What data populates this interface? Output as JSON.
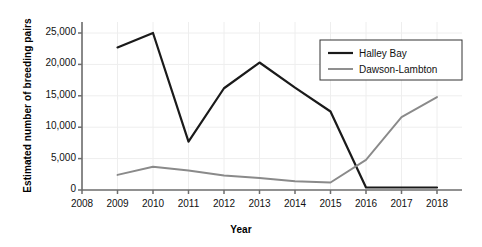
{
  "chart_data": {
    "type": "line",
    "title": "",
    "xlabel": "Year",
    "ylabel": "Estimated number of breeding pairs",
    "x": [
      2008,
      2009,
      2010,
      2011,
      2012,
      2013,
      2014,
      2015,
      2016,
      2017,
      2018
    ],
    "xlim": [
      2008,
      2018
    ],
    "ylim": [
      0,
      26500
    ],
    "yticks": [
      0,
      5000,
      10000,
      15000,
      20000,
      25000
    ],
    "ytick_labels": [
      "0",
      "5,000",
      "10,000",
      "15,000",
      "20,000",
      "25,000"
    ],
    "xtick_labels": [
      "2008",
      "2009",
      "2010",
      "2011",
      "2012",
      "2013",
      "2014",
      "2015",
      "2016",
      "2017",
      "2018"
    ],
    "grid": true,
    "legend_position": "upper right",
    "series": [
      {
        "name": "Halley Bay",
        "color": "#1a1a1a",
        "x": [
          2009,
          2010,
          2011,
          2012,
          2013,
          2014,
          2015,
          2016,
          2017,
          2018
        ],
        "values": [
          22700,
          25000,
          7700,
          16200,
          20300,
          16300,
          12500,
          400,
          400,
          400
        ]
      },
      {
        "name": "Dawson-Lambton",
        "color": "#8a8a8a",
        "x": [
          2009,
          2010,
          2011,
          2012,
          2013,
          2014,
          2015,
          2016,
          2017,
          2018
        ],
        "values": [
          2400,
          3700,
          3100,
          2300,
          1900,
          1400,
          1200,
          4800,
          11600,
          14800
        ]
      }
    ]
  },
  "legend": {
    "items": [
      {
        "label": "Halley Bay"
      },
      {
        "label": "Dawson-Lambton"
      }
    ]
  },
  "axes": {
    "x_title": "Year",
    "y_title": "Estimated number of breeding pairs"
  }
}
